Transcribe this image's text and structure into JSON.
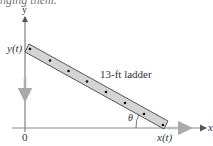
{
  "caption_fragment": "nging them.",
  "diagram": {
    "x_axis_label": "x",
    "y_axis_label": "y",
    "origin_label": "0",
    "top_point_label": "y(t)",
    "bottom_point_label": "x(t)",
    "ladder_label": "13-ft ladder",
    "angle_label": "θ",
    "ladder_length_ft": 13,
    "colors": {
      "axis": "#666666",
      "ladder_fill": "#d4d4d4",
      "ladder_stroke": "#444444",
      "motion_arrow": "#aaaaaa",
      "rung": "#111111"
    }
  }
}
